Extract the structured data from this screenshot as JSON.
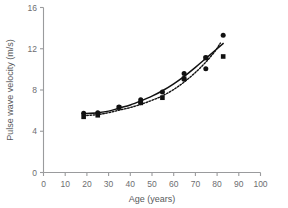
{
  "chart_data": {
    "type": "scatter",
    "title": "",
    "xlabel": "Age (years)",
    "ylabel": "Pulse wave velocity (m/s)",
    "xlim": [
      0,
      100
    ],
    "ylim": [
      0,
      16
    ],
    "xticks": [
      0,
      10,
      20,
      30,
      40,
      50,
      60,
      70,
      80,
      90,
      100
    ],
    "yticks": [
      0,
      4,
      8,
      12,
      16
    ],
    "grid": false,
    "legend": "none",
    "series": [
      {
        "name": "circle-series",
        "marker": "circle",
        "color": "#111111",
        "points": [
          [
            18.5,
            5.75
          ],
          [
            25.0,
            5.8
          ],
          [
            34.8,
            6.35
          ],
          [
            44.8,
            7.05
          ],
          [
            44.8,
            6.8
          ],
          [
            54.8,
            7.8
          ],
          [
            64.8,
            9.6
          ],
          [
            64.8,
            9.05
          ],
          [
            74.8,
            11.15
          ],
          [
            74.8,
            10.05
          ],
          [
            82.8,
            13.3
          ]
        ]
      },
      {
        "name": "square-series",
        "marker": "square",
        "color": "#111111",
        "points": [
          [
            18.5,
            5.4
          ],
          [
            25.0,
            5.55
          ],
          [
            34.8,
            6.3
          ],
          [
            44.8,
            6.75
          ],
          [
            54.8,
            7.25
          ],
          [
            64.8,
            9.1
          ],
          [
            74.8,
            11.1
          ],
          [
            82.8,
            11.25
          ]
        ]
      }
    ],
    "fits": [
      {
        "name": "solid-fit-curve",
        "style": "solid",
        "color": "#111111",
        "points": [
          [
            18.5,
            5.7
          ],
          [
            25.0,
            5.8
          ],
          [
            30.0,
            5.95
          ],
          [
            35.0,
            6.25
          ],
          [
            40.0,
            6.55
          ],
          [
            45.0,
            6.95
          ],
          [
            50.0,
            7.4
          ],
          [
            55.0,
            7.95
          ],
          [
            60.0,
            8.6
          ],
          [
            65.0,
            9.35
          ],
          [
            70.0,
            10.2
          ],
          [
            75.0,
            11.1
          ],
          [
            80.0,
            12.0
          ],
          [
            83.0,
            12.55
          ]
        ]
      },
      {
        "name": "dotted-fit-curve",
        "style": "dotted",
        "color": "#111111",
        "points": [
          [
            18.5,
            5.5
          ],
          [
            25.0,
            5.62
          ],
          [
            30.0,
            5.8
          ],
          [
            35.0,
            6.05
          ],
          [
            40.0,
            6.3
          ],
          [
            45.0,
            6.62
          ],
          [
            50.0,
            7.0
          ],
          [
            55.0,
            7.45
          ],
          [
            60.0,
            8.05
          ],
          [
            65.0,
            8.8
          ],
          [
            70.0,
            9.7
          ],
          [
            75.0,
            10.75
          ],
          [
            79.0,
            11.75
          ],
          [
            81.5,
            12.55
          ]
        ]
      }
    ]
  }
}
